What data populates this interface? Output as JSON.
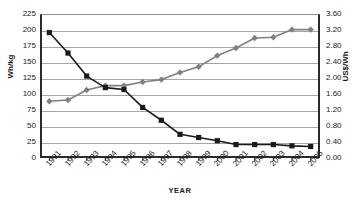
{
  "chart_data": {
    "type": "line",
    "title": "",
    "xlabel": "YEAR",
    "ylabel": "Wh/kg",
    "y2label": "US$/Wh",
    "grid": true,
    "legend": "none",
    "categories": [
      "1991",
      "1992",
      "1993",
      "1994",
      "1995",
      "1996",
      "1997",
      "1998",
      "1999",
      "2000",
      "2001",
      "2002",
      "2003",
      "2004",
      "2005"
    ],
    "ylim": [
      0,
      225
    ],
    "yticks": [
      "0",
      "25",
      "50",
      "75",
      "100",
      "125",
      "150",
      "175",
      "200",
      "225"
    ],
    "y2lim": [
      0.0,
      3.6
    ],
    "y2ticks": [
      "0.00",
      "0.40",
      "0.80",
      "1.20",
      "1.60",
      "2.00",
      "2.40",
      "2.80",
      "3.20",
      "3.60"
    ],
    "series": [
      {
        "name": "US$/Wh",
        "axis": "right",
        "marker": "diamond",
        "color": "#808080",
        "values": [
          1.42,
          1.45,
          1.7,
          1.81,
          1.81,
          1.9,
          1.96,
          2.14,
          2.28,
          2.56,
          2.75,
          3.0,
          3.02,
          3.21,
          3.21
        ]
      },
      {
        "name": "Wh/kg",
        "axis": "left",
        "marker": "square",
        "color": "#1a1a1a",
        "values": [
          196,
          164,
          128,
          110,
          107,
          79,
          59,
          37,
          32,
          27,
          21,
          21,
          21,
          19,
          18
        ]
      }
    ]
  }
}
